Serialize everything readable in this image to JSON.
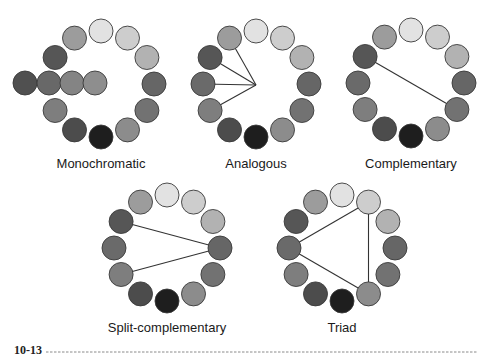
{
  "figure": {
    "number": "10-13",
    "rule_color": "#8a8a8a"
  },
  "palette": {
    "clock_positions": [
      "12",
      "1",
      "2",
      "3",
      "4",
      "5",
      "6",
      "7",
      "8",
      "9",
      "10",
      "11"
    ],
    "greys": [
      "#e2e2e2",
      "#cdcdcd",
      "#b2b2b2",
      "#666666",
      "#727272",
      "#8c8c8c",
      "#1e1e1e",
      "#4c4c4c",
      "#7e7e7e",
      "#6a6a6a",
      "#565656",
      "#9c9c9c"
    ],
    "outline": "#3a3a3a"
  },
  "wheels": [
    {
      "id": "monochromatic",
      "label": "Monochromatic",
      "center": [
        101,
        84
      ],
      "ring_radius": 53,
      "swatch_radius": 12,
      "omit_positions": [
        9
      ],
      "extra_row": {
        "y": 83,
        "x": [
          25,
          49,
          72,
          95
        ],
        "colors": [
          "#505050",
          "#686868",
          "#848484",
          "#8e8e8e"
        ]
      },
      "lines": [],
      "label_pos": [
        101,
        168
      ]
    },
    {
      "id": "analogous",
      "label": "Analogous",
      "center": [
        256,
        84
      ],
      "ring_radius": 53,
      "swatch_radius": 12,
      "omit_positions": [],
      "hub": [
        256,
        85
      ],
      "lines": [
        {
          "from_hub": true,
          "to": 11
        },
        {
          "from_hub": true,
          "to": 10
        },
        {
          "from_hub": true,
          "to": 9
        },
        {
          "from_hub": true,
          "to": 8
        }
      ],
      "label_pos": [
        256,
        168
      ]
    },
    {
      "id": "complementary",
      "label": "Complementary",
      "center": [
        411,
        83
      ],
      "ring_radius": 53,
      "swatch_radius": 12,
      "omit_positions": [],
      "lines": [
        {
          "from": 10,
          "to": 4
        }
      ],
      "label_pos": [
        411,
        168
      ]
    },
    {
      "id": "split-complementary",
      "label": "Split-complementary",
      "center": [
        167,
        248
      ],
      "ring_radius": 53,
      "swatch_radius": 12,
      "omit_positions": [],
      "lines": [
        {
          "from": 10,
          "to": 3
        },
        {
          "from": 8,
          "to": 3
        }
      ],
      "label_pos": [
        167,
        332
      ]
    },
    {
      "id": "triad",
      "label": "Triad",
      "center": [
        342,
        248
      ],
      "ring_radius": 53,
      "swatch_radius": 12,
      "omit_positions": [],
      "lines": [
        {
          "from": 1,
          "to": 9
        },
        {
          "from": 9,
          "to": 5
        },
        {
          "from": 5,
          "to": 1
        }
      ],
      "label_pos": [
        342,
        332
      ]
    }
  ]
}
